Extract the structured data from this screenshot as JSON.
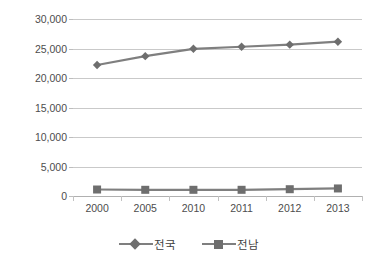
{
  "chart_data": {
    "type": "line",
    "title": "",
    "xlabel": "",
    "ylabel": "",
    "categories": [
      "2000",
      "2005",
      "2010",
      "2011",
      "2012",
      "2013"
    ],
    "ytick_labels": [
      "30,000",
      "25,000",
      "20,000",
      "15,000",
      "10,000",
      "5,000",
      "0"
    ],
    "ytick_values": [
      30000,
      25000,
      20000,
      15000,
      10000,
      5000,
      0
    ],
    "ylim": [
      0,
      30000
    ],
    "grid": true,
    "legend_position": "bottom",
    "series": [
      {
        "name": "전국",
        "marker": "diamond",
        "color": "#7f7f7f",
        "values": [
          22200,
          23700,
          24950,
          25300,
          25650,
          26150
        ]
      },
      {
        "name": "전남",
        "marker": "square",
        "color": "#7f7f7f",
        "values": [
          1100,
          1050,
          1050,
          1050,
          1150,
          1280
        ]
      }
    ]
  },
  "legend": {
    "entries": [
      {
        "label": "전국",
        "marker": "diamond"
      },
      {
        "label": "전남",
        "marker": "square"
      }
    ]
  },
  "colors": {
    "series": "#7f7f7f",
    "marker": "#6e6e6e",
    "gridline": "#c9c9c9",
    "axis": "#b0b0b0",
    "tick_text": "#4d4d4d",
    "background": "#ffffff"
  }
}
